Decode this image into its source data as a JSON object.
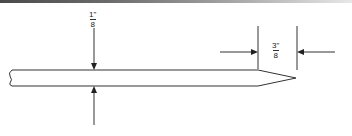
{
  "drawing": {
    "title": "Pointed rod dimension drawing",
    "dimensions": {
      "rod_diameter": {
        "numerator": "1\"",
        "denominator": "8",
        "label": "1/8\""
      },
      "taper_length": {
        "numerator": "3\"",
        "denominator": "8",
        "label": "3/8\""
      }
    },
    "colors": {
      "line": "#333333",
      "background": "#ffffff"
    }
  }
}
